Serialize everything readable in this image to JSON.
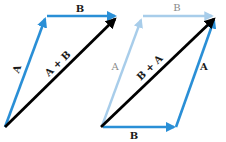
{
  "figure": {
    "colors": {
      "vector": "#2a8fd6",
      "vector_faded": "#a8cdea",
      "resultant": "#000000",
      "label": "#1a1a1a",
      "label_faded": "#8a8a8a"
    },
    "left_diagram": {
      "vectors": [
        {
          "name": "A",
          "label": "A",
          "role": "first"
        },
        {
          "name": "B",
          "label": "B",
          "role": "second"
        },
        {
          "name": "A+B",
          "label": "A + B",
          "role": "resultant"
        }
      ]
    },
    "right_diagram": {
      "vectors": [
        {
          "name": "B",
          "label": "B",
          "role": "first"
        },
        {
          "name": "A",
          "label": "A",
          "role": "second"
        },
        {
          "name": "A-faded",
          "label": "A",
          "role": "faded"
        },
        {
          "name": "B-faded",
          "label": "B",
          "role": "faded"
        },
        {
          "name": "B+A",
          "label": "B + A",
          "role": "resultant"
        }
      ]
    }
  }
}
